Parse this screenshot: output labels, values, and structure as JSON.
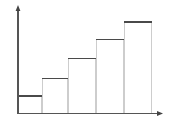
{
  "chart_data": {
    "type": "bar",
    "title": "",
    "subtitle": "",
    "xlabel": "",
    "ylabel": "",
    "categories": [
      "1",
      "2",
      "3",
      "4",
      "5"
    ],
    "values": [
      17,
      35,
      55,
      74,
      92
    ],
    "ylim": [
      0,
      107
    ],
    "xlim": [
      0,
      5
    ],
    "grid": false,
    "legend": null,
    "tick_labels_x": [],
    "tick_labels_y": [],
    "annotations": [],
    "series": [
      {
        "name": "bars",
        "values": [
          17,
          35,
          55,
          74,
          92
        ]
      }
    ],
    "style": {
      "bar_top_color": "#4a4a4a",
      "bar_side_color": "#c8c8c8",
      "bar_fill_color": "#ffffff",
      "axis_color": "#555555",
      "background_color": "#ffffff",
      "axis_arrows": true
    },
    "geometry": {
      "axis_x_y": 113,
      "axis_y_x": 18,
      "axis_y_top": 7,
      "axis_x_right": 162,
      "bar_edges_x": [
        18,
        42,
        68,
        96,
        124,
        152
      ],
      "bar_tops_y": [
        96,
        78,
        58,
        39,
        21
      ]
    }
  },
  "figure": {
    "name": "ascending-bar-chart"
  }
}
